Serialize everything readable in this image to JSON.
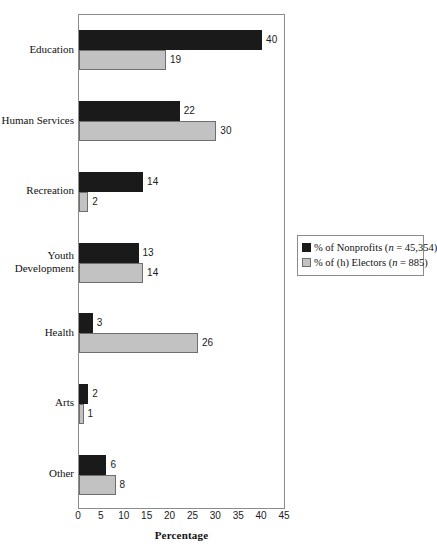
{
  "chart_data": {
    "type": "bar",
    "orientation": "horizontal",
    "title": "",
    "xlabel": "Percentage",
    "ylabel": "",
    "xlim": [
      0,
      45
    ],
    "xticks": [
      0,
      5,
      10,
      15,
      20,
      25,
      30,
      35,
      40,
      45
    ],
    "grid": false,
    "legend_position": "right",
    "categories": [
      "Education",
      "Human Services",
      "Recreation",
      "Youth\nDevelopment",
      "Health",
      "Arts",
      "Other"
    ],
    "series": [
      {
        "name": "% of Nonprofits (n = 45,354)",
        "color": "#1a1a1a",
        "values": [
          40,
          22,
          14,
          13,
          3,
          2,
          6
        ]
      },
      {
        "name": "% of (h) Electors (n = 885)",
        "color": "#c2c2c2",
        "values": [
          19,
          30,
          2,
          14,
          26,
          1,
          8
        ]
      }
    ]
  },
  "legend": {
    "entries": [
      {
        "label_plain": "% of Nonprofits (n = 45,354)",
        "prefix": "% of Nonprofits (",
        "italic": "n",
        "suffix": " = 45,354)",
        "swatch": "dark"
      },
      {
        "label_plain": "% of (h) Electors (n = 885)",
        "prefix": "% of (h) Electors (",
        "italic": "n",
        "suffix": " = 885)",
        "swatch": "light"
      }
    ]
  },
  "axis": {
    "x_title": "Percentage",
    "x_tick_labels": [
      "0",
      "5",
      "10",
      "15",
      "20",
      "25",
      "30",
      "35",
      "40",
      "45"
    ]
  },
  "colors": {
    "series_dark": "#1a1a1a",
    "series_light": "#c2c2c2",
    "frame": "#8c8c8c",
    "background": "#ffffff",
    "text": "#111111"
  }
}
